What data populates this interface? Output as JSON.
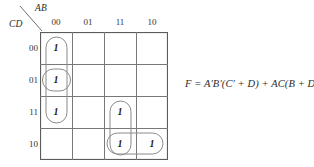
{
  "figure": {
    "type": "karnaugh-map",
    "corner": {
      "top_variable_label": "AB",
      "side_variable_label": "CD"
    },
    "column_headers": [
      "00",
      "01",
      "11",
      "10"
    ],
    "row_headers": [
      "00",
      "01",
      "11",
      "10"
    ],
    "cells": [
      {
        "row": 0,
        "col": 0,
        "value": "1"
      },
      {
        "row": 1,
        "col": 0,
        "value": "1"
      },
      {
        "row": 2,
        "col": 0,
        "value": "1"
      },
      {
        "row": 2,
        "col": 2,
        "value": "1"
      },
      {
        "row": 3,
        "col": 2,
        "value": "1"
      },
      {
        "row": 3,
        "col": 3,
        "value": "1"
      }
    ],
    "groups": [
      {
        "name": "group-column-00-rows-00-01-11",
        "shape": "vertical-oval"
      },
      {
        "name": "group-cell-col00-row01",
        "shape": "single-oval"
      },
      {
        "name": "group-column-11-rows-11-10",
        "shape": "vertical-oval"
      },
      {
        "name": "group-row-10-cols-11-10",
        "shape": "horizontal-oval"
      }
    ],
    "expression": "F = A′B′(C′ + D) + AC(B + D′)",
    "colors": {
      "grid_line": "#6e6e6e",
      "group_outline": "#8a8a8a",
      "text": "#2b2b2b"
    }
  }
}
